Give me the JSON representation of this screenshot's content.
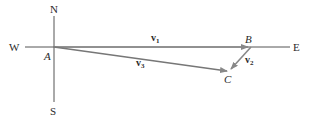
{
  "diagram": {
    "compass": {
      "north": "N",
      "south": "S",
      "west": "W",
      "east": "E"
    },
    "points": {
      "A": "A",
      "B": "B",
      "C": "C"
    },
    "vectors": [
      {
        "name": "v",
        "sub": "1",
        "from": "A",
        "to": "B"
      },
      {
        "name": "v",
        "sub": "2",
        "from": "B",
        "to": "C"
      },
      {
        "name": "v",
        "sub": "3",
        "from": "A",
        "to": "C"
      }
    ],
    "colors": {
      "axis": "#555555",
      "vector": "#888888",
      "text": "#2a2a2a"
    }
  }
}
